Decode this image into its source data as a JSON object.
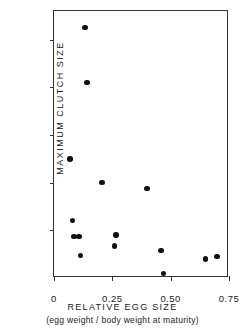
{
  "chart_data": {
    "type": "scatter",
    "title": "",
    "xlabel": "RELATIVE EGG SIZE",
    "xlabel_sub": "(egg weight / body weight at maturity)",
    "ylabel": "MAXIMUM CLUTCH SIZE",
    "xlim": [
      0,
      0.75
    ],
    "ylim": [
      0,
      112
    ],
    "grid": false,
    "legend": null,
    "xticks": [
      {
        "value": 0,
        "label": "0"
      },
      {
        "value": 0.25,
        "label": "0.25"
      },
      {
        "value": 0.5,
        "label": "0.50"
      },
      {
        "value": 0.75,
        "label": "0.75"
      }
    ],
    "yticks": [
      {
        "value": 20,
        "label": "20"
      },
      {
        "value": 40,
        "label": "40"
      },
      {
        "value": 60,
        "label": "60"
      },
      {
        "value": 80,
        "label": "80"
      },
      {
        "value": 100,
        "label": "100"
      }
    ],
    "marker": "filled-circle",
    "marker_color": "#111111",
    "points": [
      {
        "x": 0.133,
        "y": 105
      },
      {
        "x": 0.141,
        "y": 82
      },
      {
        "x": 0.069,
        "y": 50
      },
      {
        "x": 0.206,
        "y": 40
      },
      {
        "x": 0.399,
        "y": 37.5
      },
      {
        "x": 0.08,
        "y": 24
      },
      {
        "x": 0.265,
        "y": 18
      },
      {
        "x": 0.086,
        "y": 17.5
      },
      {
        "x": 0.107,
        "y": 17.5
      },
      {
        "x": 0.258,
        "y": 13.5
      },
      {
        "x": 0.459,
        "y": 11.5
      },
      {
        "x": 0.113,
        "y": 9.5
      },
      {
        "x": 0.648,
        "y": 8
      },
      {
        "x": 0.699,
        "y": 9
      },
      {
        "x": 0.47,
        "y": 2
      }
    ]
  }
}
